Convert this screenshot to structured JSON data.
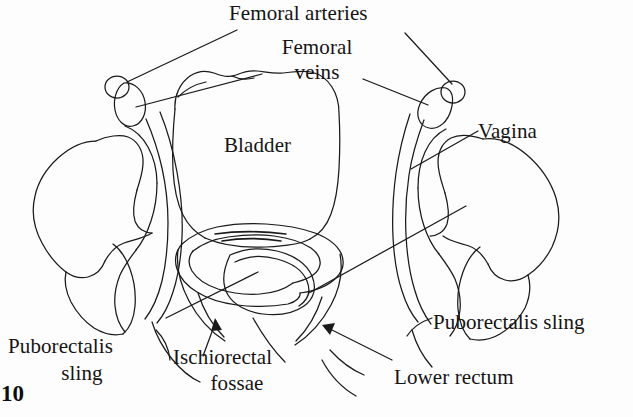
{
  "figure": {
    "kind": "hand-drawn-anatomical-line-diagram",
    "ink_color": "#1a1a1a",
    "background_color": "#fdfdfd",
    "page_number": "10"
  },
  "labels": {
    "femoral_arteries": "Femoral arteries",
    "femoral_veins_line1": "Femoral",
    "femoral_veins_line2": "veins",
    "bladder": "Bladder",
    "vagina": "Vagina",
    "puborectalis_sling_right": "Puborectalis sling",
    "puborectalis_sling_left_line1": "Puborectalis",
    "puborectalis_sling_left_line2": "sling",
    "ischiorectal_fossae_line1": "Ischiorectal",
    "ischiorectal_fossae_line2": "fossae",
    "lower_rectum": "Lower rectum"
  },
  "structures": [
    "femoral artery left",
    "femoral vein left",
    "femoral artery right",
    "femoral vein right",
    "bladder",
    "vagina",
    "puborectalis sling left",
    "puborectalis sling right",
    "ischiorectal fossa left",
    "ischiorectal fossa right",
    "lower rectum",
    "ilium left",
    "ilium right",
    "femoral head left",
    "femoral head right"
  ]
}
